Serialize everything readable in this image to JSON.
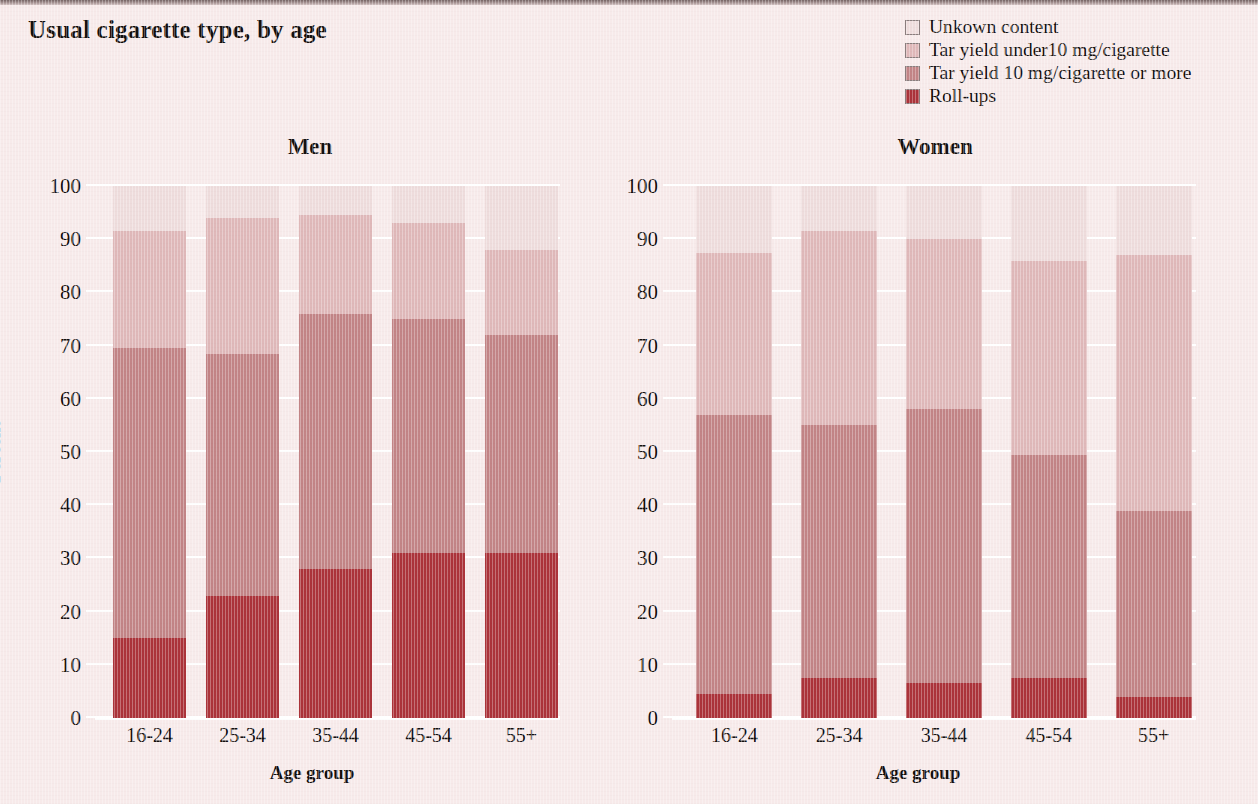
{
  "title": "Usual cigarette type, by age",
  "legend": {
    "items": [
      {
        "label": "Unkown content",
        "color": "#eedcdc"
      },
      {
        "label": "Tar yield under10 mg/cigarette",
        "color": "#dfb8b9"
      },
      {
        "label": "Tar yield 10 mg/cigarette or more",
        "color": "#c28486"
      },
      {
        "label": "Roll-ups",
        "color": "#ab333a"
      }
    ]
  },
  "chart_data": {
    "type": "bar",
    "subtype": "stacked-100-percent",
    "title": "Usual cigarette type, by age",
    "xlabel": "Age group",
    "ylabel": "Percent",
    "ylim": [
      0,
      100
    ],
    "yticks": [
      0,
      10,
      20,
      30,
      40,
      50,
      60,
      70,
      80,
      90,
      100
    ],
    "grid": true,
    "legend_position": "top-right",
    "categories": [
      "16-24",
      "25-34",
      "35-44",
      "45-54",
      "55+"
    ],
    "panels": [
      {
        "name": "Men",
        "series": [
          {
            "name": "Roll-ups",
            "color": "#ab333a",
            "values": [
              15,
              23,
              28,
              31,
              31
            ]
          },
          {
            "name": "Tar yield 10 mg/cigarette or more",
            "color": "#c28486",
            "values": [
              54.5,
              45.5,
              48,
              44,
              41
            ]
          },
          {
            "name": "Tar yield under10 mg/cigarette",
            "color": "#dfb8b9",
            "values": [
              22,
              25.5,
              18.5,
              18,
              16
            ]
          },
          {
            "name": "Unkown content",
            "color": "#eedcdc",
            "values": [
              8.5,
              6,
              5.5,
              7,
              12
            ]
          }
        ],
        "cumulative_tops": [
          {
            "category": "16-24",
            "rollups": 15,
            "tar10plus": 69.5,
            "tarunder10": 91.5,
            "unknown": 100
          },
          {
            "category": "25-34",
            "rollups": 23,
            "tar10plus": 68.5,
            "tarunder10": 94,
            "unknown": 100
          },
          {
            "category": "35-44",
            "rollups": 28,
            "tar10plus": 76,
            "tarunder10": 94.5,
            "unknown": 100
          },
          {
            "category": "45-54",
            "rollups": 31,
            "tar10plus": 75,
            "tarunder10": 93,
            "unknown": 100
          },
          {
            "category": "55+",
            "rollups": 31,
            "tar10plus": 72,
            "tarunder10": 88,
            "unknown": 100
          }
        ]
      },
      {
        "name": "Women",
        "series": [
          {
            "name": "Roll-ups",
            "color": "#ab333a",
            "values": [
              4.5,
              7.5,
              6.5,
              7.5,
              4
            ]
          },
          {
            "name": "Tar yield 10 mg/cigarette or more",
            "color": "#c28486",
            "values": [
              52.5,
              47.5,
              51.5,
              42,
              35
            ]
          },
          {
            "name": "Tar yield under10 mg/cigarette",
            "color": "#dfb8b9",
            "values": [
              30.5,
              36.5,
              32,
              36.5,
              48
            ]
          },
          {
            "name": "Unkown content",
            "color": "#eedcdc",
            "values": [
              12.5,
              8.5,
              10,
              14,
              13
            ]
          }
        ],
        "cumulative_tops": [
          {
            "category": "16-24",
            "rollups": 4.5,
            "tar10plus": 57,
            "tarunder10": 87.5,
            "unknown": 100
          },
          {
            "category": "25-34",
            "rollups": 7.5,
            "tar10plus": 55,
            "tarunder10": 91.5,
            "unknown": 100
          },
          {
            "category": "35-44",
            "rollups": 6.5,
            "tar10plus": 58,
            "tarunder10": 90,
            "unknown": 100
          },
          {
            "category": "45-54",
            "rollups": 7.5,
            "tar10plus": 49.5,
            "tarunder10": 86,
            "unknown": 100
          },
          {
            "category": "55+",
            "rollups": 4,
            "tar10plus": 39,
            "tarunder10": 87,
            "unknown": 100
          }
        ]
      }
    ]
  }
}
